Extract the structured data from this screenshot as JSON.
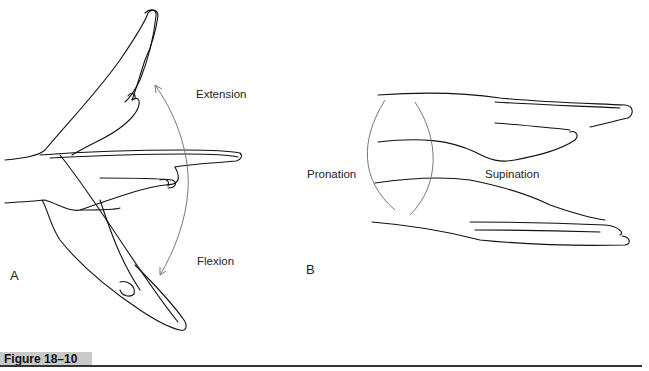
{
  "figure": {
    "caption_label": "Figure 18–10",
    "panels": [
      {
        "id": "A",
        "label": "A",
        "motions": [
          "Extension",
          "Flexion"
        ]
      },
      {
        "id": "B",
        "label": "B",
        "motions": [
          "Pronation",
          "Supination"
        ]
      }
    ]
  }
}
